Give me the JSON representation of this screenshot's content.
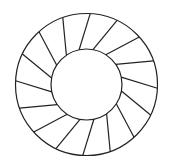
{
  "diagram": {
    "type": "segmented-annulus",
    "width": 170,
    "height": 166,
    "background": "#ffffff",
    "stroke_color": "#222222",
    "stroke_width": 1.2,
    "center": {
      "x": 86.5,
      "y": 84.5
    },
    "outer_radius": 71,
    "inner_radius": 35.5,
    "segment_count": 16,
    "start_angle_deg": 3,
    "spoke_skew_deg": -15
  }
}
